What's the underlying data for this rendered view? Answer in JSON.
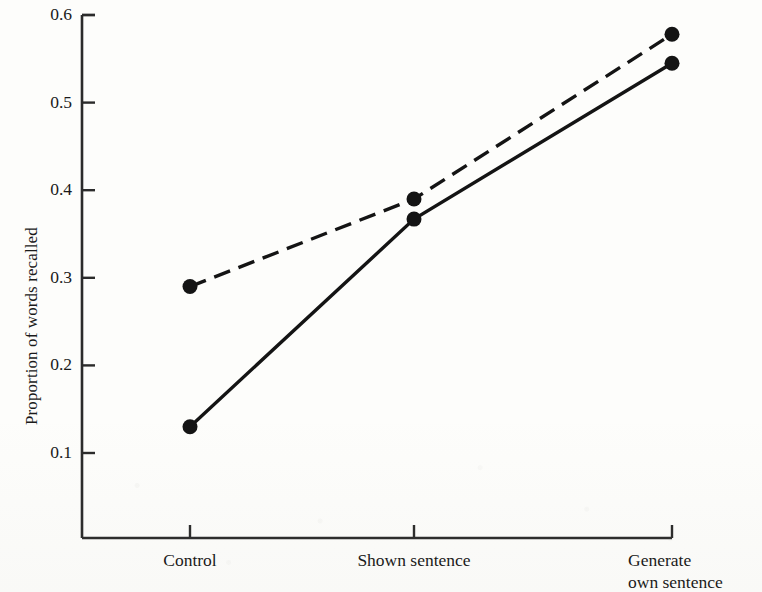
{
  "chart_data": {
    "type": "line",
    "title": "",
    "subtitle": "",
    "xlabel": "",
    "ylabel": "Proportion of words recalled",
    "categories": [
      "Control",
      "Shown sentence",
      "Generate own sentence"
    ],
    "category_labels_multiline": [
      [
        "Control"
      ],
      [
        "Shown sentence"
      ],
      [
        "Generate",
        "own sentence"
      ]
    ],
    "ylim": [
      0.0,
      0.6
    ],
    "yticks": [
      0.1,
      0.2,
      0.3,
      0.4,
      0.5,
      0.6
    ],
    "ytick_labels": [
      "0.1",
      "0.2",
      "0.3",
      "0.4",
      "0.5",
      "0.6"
    ],
    "grid": false,
    "legend": "none",
    "axis_color": "#2b2b2b",
    "series": [
      {
        "name": "dashed-series",
        "style": "dashed",
        "color": "#141414",
        "marker": "filled-circle",
        "values": [
          0.29,
          0.39,
          0.578
        ]
      },
      {
        "name": "solid-series",
        "style": "solid",
        "color": "#141414",
        "marker": "filled-circle",
        "values": [
          0.13,
          0.367,
          0.545
        ]
      }
    ]
  }
}
